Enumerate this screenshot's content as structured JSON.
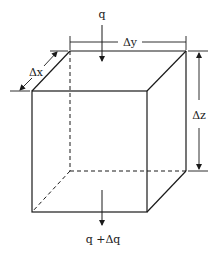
{
  "diagram": {
    "title": "",
    "labels": {
      "inflow": "q",
      "outflow": "q +Δq",
      "dx": "Δx",
      "dy": "Δy",
      "dz": "Δz"
    },
    "colors": {
      "line": "#1a1a1a",
      "background": "#ffffff"
    },
    "geometry": {
      "type": "cube-control-volume",
      "front_face": {
        "x1": 32,
        "y1": 91,
        "x2": 147,
        "y2": 212
      },
      "back_offset": {
        "dx": 38,
        "dy": -40
      }
    }
  }
}
